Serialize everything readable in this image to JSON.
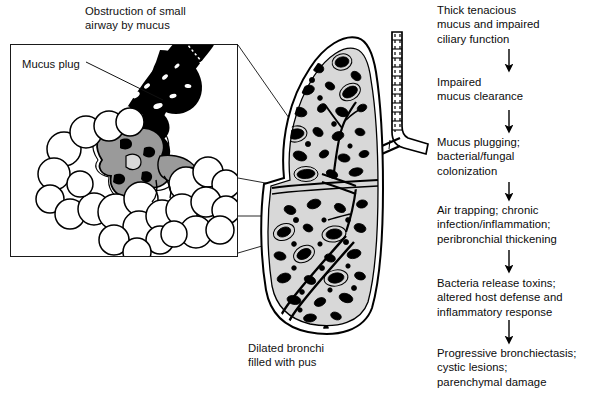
{
  "figure": {
    "title": "Obstruction of small\nairway by mucus",
    "inset_label": "Mucus plug",
    "lung_caption": "Dilated bronchi\nfilled with pus"
  },
  "flowchart": {
    "orientation": "vertical",
    "arrow_glyph": "down-arrow",
    "steps": [
      {
        "id": "step-1",
        "text": "Thick tenacious\nmucus and impaired\nciliary function"
      },
      {
        "id": "step-2",
        "text": "Impaired\nmucus clearance"
      },
      {
        "id": "step-3",
        "text": "Mucus plugging;\nbacterial/fungal\ncolonization"
      },
      {
        "id": "step-4",
        "text": "Air trapping; chronic\ninfection/inflammation;\nperibronchial thickening"
      },
      {
        "id": "step-5",
        "text": "Bacteria release toxins;\naltered host defense and\ninflammatory response"
      },
      {
        "id": "step-6",
        "text": "Progressive bronchiectasis;\ncystic lesions;\nparenchymal damage"
      }
    ]
  },
  "illustration": {
    "inset_name": "alveoli-with-mucus-plug",
    "lung_name": "lung-cross-section-with-dilated-bronchi",
    "airway_name": "trachea-and-bronchus"
  },
  "colors": {
    "ink": "#000000",
    "paper": "#ffffff",
    "lung_parenchyma": "#d8d8d8",
    "mucus_gray": "#9a9a9a",
    "mucus_black": "#000000"
  }
}
